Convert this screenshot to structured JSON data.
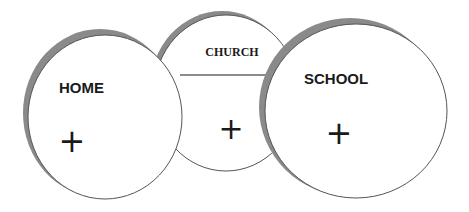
{
  "diagram": {
    "circles": [
      {
        "id": "church",
        "label": "CHURCH",
        "marker": "+"
      },
      {
        "id": "home",
        "label": "HOME",
        "marker": "+"
      },
      {
        "id": "school",
        "label": "SCHOOL",
        "marker": "+"
      }
    ],
    "colors": {
      "fill": "#ffffff",
      "outline": "#555555",
      "shadow": "#8a8a8a",
      "text": "#1a1a1a"
    }
  }
}
